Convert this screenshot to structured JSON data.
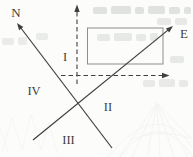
{
  "figure": {
    "type": "geometry-diagram",
    "axis_labels": {
      "north": "N",
      "east": "E"
    },
    "region_labels": {
      "region_1": "I",
      "region_2": "II",
      "region_3": "III",
      "region_4": "IV"
    },
    "colors": {
      "ink": "#3f3f3f",
      "rectangle_stroke": "#8e8e8e",
      "background": "#fcfcfb",
      "bleedthrough": "#aab0aa"
    }
  }
}
